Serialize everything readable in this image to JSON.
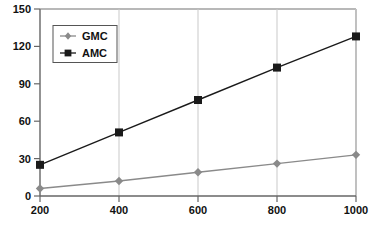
{
  "chart_data": {
    "type": "line",
    "title": "",
    "xlabel": "",
    "ylabel": "",
    "x": [
      200,
      400,
      600,
      800,
      1000
    ],
    "xtick_labels": [
      "200",
      "400",
      "600",
      "800",
      "1000"
    ],
    "ytick_labels": [
      "0",
      "30",
      "60",
      "90",
      "120",
      "150"
    ],
    "yticks": [
      0,
      30,
      60,
      90,
      120,
      150
    ],
    "xlim": [
      200,
      1000
    ],
    "ylim": [
      0,
      150
    ],
    "grid": false,
    "legend_position": "upper-left-inside",
    "series": [
      {
        "name": "GMC",
        "marker": "diamond",
        "color": "#8a8a8a",
        "values": [
          6,
          12,
          19,
          26,
          33
        ]
      },
      {
        "name": "AMC",
        "marker": "square",
        "color": "#1a1a1a",
        "values": [
          25,
          51,
          77,
          103,
          128
        ]
      }
    ]
  },
  "legend": {
    "items": [
      {
        "label": "GMC",
        "marker": "diamond-marker",
        "color": "#8a8a8a"
      },
      {
        "label": "AMC",
        "marker": "square-marker",
        "color": "#1a1a1a"
      }
    ]
  },
  "axes": {
    "y_labels": [
      "150",
      "120",
      "90",
      "60",
      "30",
      "0"
    ],
    "x_labels": [
      "200",
      "400",
      "600",
      "800",
      "1000"
    ]
  },
  "colors": {
    "background": "#ffffff",
    "axis": "#666666",
    "frame": "#b8b8b8",
    "gridline": "#c9c9c9",
    "series_gmc": "#8a8a8a",
    "series_amc": "#1a1a1a",
    "text": "#111111"
  }
}
